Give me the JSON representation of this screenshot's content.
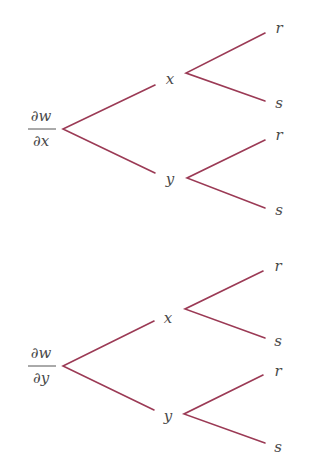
{
  "colors": {
    "branch": "#9b3a55",
    "text": "#4a4a4a",
    "background": "#ffffff"
  },
  "trees": [
    {
      "root": {
        "numerator": "∂w",
        "denominator": "∂x",
        "label": "∂w/∂x"
      },
      "level1": [
        {
          "label": "x",
          "children": [
            "r",
            "s"
          ]
        },
        {
          "label": "y",
          "children": [
            "r",
            "s"
          ]
        }
      ]
    },
    {
      "root": {
        "numerator": "∂w",
        "denominator": "∂y",
        "label": "∂w/∂y"
      },
      "level1": [
        {
          "label": "x",
          "children": [
            "r",
            "s"
          ]
        },
        {
          "label": "y",
          "children": [
            "r",
            "s"
          ]
        }
      ]
    }
  ]
}
